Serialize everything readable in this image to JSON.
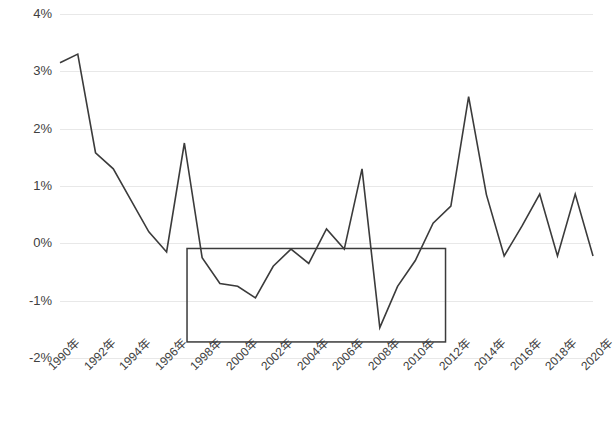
{
  "chart_data": {
    "type": "line",
    "title": "",
    "subtitle": "",
    "xlabel": "",
    "ylabel": "",
    "grid": true,
    "legend": "none",
    "xlim": [
      1990,
      2020
    ],
    "ylim": [
      -0.02,
      0.04
    ],
    "y_tick_labels": [
      "4%",
      "3%",
      "2%",
      "1%",
      "0%",
      "-1%",
      "-2%"
    ],
    "y_tick_values": [
      4,
      3,
      2,
      1,
      0,
      -1,
      -2
    ],
    "y_unit": "%",
    "x_tick_labels": [
      "1990年",
      "1992年",
      "1994年",
      "1996年",
      "1998年",
      "2000年",
      "2002年",
      "2004年",
      "2006年",
      "2008年",
      "2010年",
      "2012年",
      "2014年",
      "2016年",
      "2018年",
      "2020年"
    ],
    "x_tick_values": [
      1990,
      1992,
      1994,
      1996,
      1998,
      2000,
      2002,
      2004,
      2006,
      2008,
      2010,
      2012,
      2014,
      2016,
      2018,
      2020
    ],
    "x": [
      1990,
      1991,
      1992,
      1993,
      1994,
      1995,
      1996,
      1997,
      1998,
      1999,
      2000,
      2001,
      2002,
      2003,
      2004,
      2005,
      2006,
      2007,
      2008,
      2009,
      2010,
      2011,
      2012,
      2013,
      2014,
      2015,
      2016,
      2017,
      2018,
      2019,
      2020
    ],
    "series": [
      {
        "name": "series-1",
        "color": "#3b3b3b",
        "values": [
          3.15,
          3.3,
          1.58,
          1.3,
          0.75,
          0.2,
          -0.15,
          1.75,
          -0.25,
          -0.7,
          -0.75,
          -0.95,
          -0.4,
          -0.1,
          -0.35,
          0.25,
          -0.1,
          1.3,
          -1.47,
          -0.75,
          -0.3,
          0.35,
          0.65,
          2.56,
          0.85,
          -0.22,
          0.3,
          0.86,
          -0.22,
          0.86,
          -0.22
        ]
      }
    ],
    "annotations": [
      {
        "type": "rectangle",
        "name": "highlight-rectangle",
        "x_start": 1997.15,
        "x_end": 2011.7,
        "y_top": -0.09,
        "y_bottom": -1.72,
        "stroke": "#3b3b3b",
        "fill": "none"
      }
    ],
    "colors": {
      "line": "#3b3b3b",
      "gridline": "#e8e8e8",
      "tick_text": "#404040",
      "background": "#ffffff"
    }
  }
}
